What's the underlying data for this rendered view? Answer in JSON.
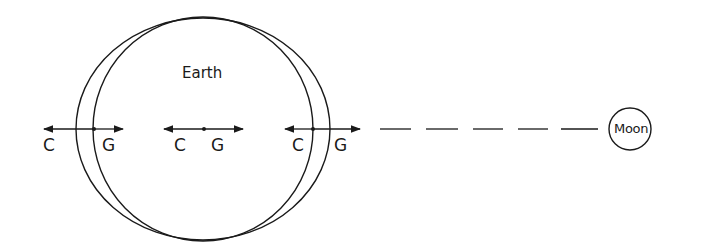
{
  "diagram": {
    "earth_label": "Earth",
    "moon_label": "Moon",
    "points": [
      {
        "id": "far-side",
        "c_label": "C",
        "g_label": "G"
      },
      {
        "id": "center",
        "c_label": "C",
        "g_label": "G"
      },
      {
        "id": "near-side",
        "c_label": "C",
        "g_label": "G"
      }
    ],
    "colors": {
      "stroke": "#1a1a1a",
      "background": "#ffffff"
    }
  }
}
